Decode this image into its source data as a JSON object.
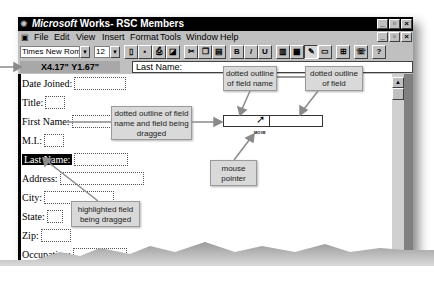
{
  "window": {
    "app_name": "Microsoft",
    "title_rest": " Works- RSC Members",
    "controls": [
      "minimize",
      "restore",
      "close"
    ]
  },
  "menubar": {
    "items": [
      "File",
      "Edit",
      "View",
      "Insert",
      "Format",
      "Tools",
      "Window",
      "Help"
    ]
  },
  "toolbar": {
    "font_name": "Times New Roman",
    "font_size": "12",
    "buttons": [
      {
        "name": "new-icon",
        "glyph": "▯"
      },
      {
        "name": "save-icon",
        "glyph": "▪"
      },
      {
        "name": "print-icon",
        "glyph": "⎙"
      },
      {
        "name": "print-preview-icon",
        "glyph": "◪"
      },
      {
        "name": "cut-icon",
        "glyph": "✂"
      },
      {
        "name": "copy-icon",
        "glyph": "❐"
      },
      {
        "name": "paste-icon",
        "glyph": "▤"
      },
      {
        "name": "bold-icon",
        "glyph": "B"
      },
      {
        "name": "italic-icon",
        "glyph": "/"
      },
      {
        "name": "underline-icon",
        "glyph": "U"
      },
      {
        "name": "form-view-icon",
        "glyph": "▥"
      },
      {
        "name": "list-view-icon",
        "glyph": "▦"
      },
      {
        "name": "form-design-icon",
        "glyph": "✎"
      },
      {
        "name": "report-view-icon",
        "glyph": "▭"
      },
      {
        "name": "field-icon",
        "glyph": "⊞"
      },
      {
        "name": "address-book-icon",
        "glyph": "☏"
      },
      {
        "name": "help-icon",
        "glyph": "?"
      }
    ]
  },
  "formula_bar": {
    "coordinates": "X4.17\" Y1.67\"",
    "entry_text": "Last Name:"
  },
  "form": {
    "fields": [
      {
        "label": "Date Joined:",
        "box_width": 50
      },
      {
        "label": "Title:",
        "box_width": 18
      },
      {
        "label": "First Name:",
        "box_width": 62
      },
      {
        "label": "M.I.:",
        "box_width": 18
      },
      {
        "label": "Last Name:",
        "box_width": 60,
        "highlighted": true
      },
      {
        "label": "Address:",
        "box_width": 82
      },
      {
        "label": "City:",
        "box_width": 68
      },
      {
        "label": "State:",
        "box_width": 14
      },
      {
        "label": "Zip:",
        "box_width": 28
      },
      {
        "label": "Occupation:",
        "box_width": 52
      }
    ]
  },
  "drag": {
    "cursor_label": "MOVE"
  },
  "callouts": {
    "field_name": "dotted outline of field name",
    "field": "dotted outline of field",
    "dragging": "dotted outline of field name and field being dragged",
    "mouse": "mouse pointer",
    "highlighted": "highlighted field being dragged"
  }
}
